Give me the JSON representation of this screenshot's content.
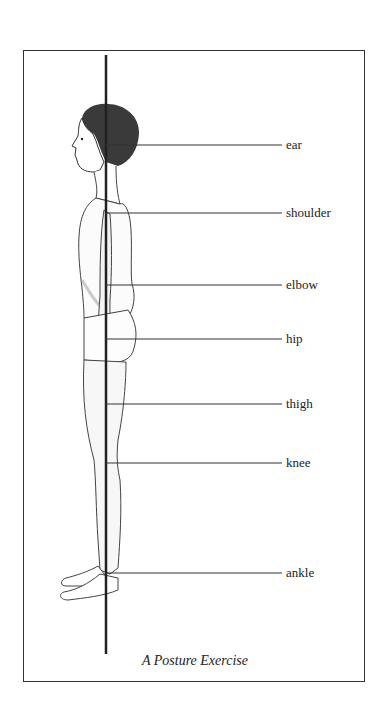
{
  "diagram": {
    "caption": "A Posture Exercise",
    "plumb_line": {
      "x": 106,
      "y_top": 55,
      "y_bottom": 654
    },
    "labels": [
      {
        "text": "ear",
        "y": 145
      },
      {
        "text": "shoulder",
        "y": 213
      },
      {
        "text": "elbow",
        "y": 285
      },
      {
        "text": "hip",
        "y": 339
      },
      {
        "text": "thigh",
        "y": 404
      },
      {
        "text": "knee",
        "y": 463
      },
      {
        "text": "ankle",
        "y": 573
      }
    ],
    "colors": {
      "ink": "#222222",
      "frame": "#333333"
    }
  }
}
